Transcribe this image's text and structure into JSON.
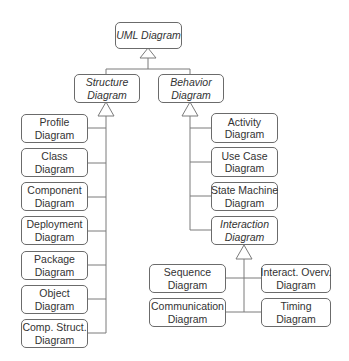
{
  "root": {
    "line1": "UML Diagram",
    "abstract": true
  },
  "structure": {
    "header": {
      "line1": "Structure",
      "line2": "Diagram",
      "abstract": true
    },
    "children": [
      {
        "line1": "Profile",
        "line2": "Diagram"
      },
      {
        "line1": "Class",
        "line2": "Diagram"
      },
      {
        "line1": "Component",
        "line2": "Diagram"
      },
      {
        "line1": "Deployment",
        "line2": "Diagram"
      },
      {
        "line1": "Package",
        "line2": "Diagram"
      },
      {
        "line1": "Object",
        "line2": "Diagram"
      },
      {
        "line1": "Comp. Struct.",
        "line2": "Diagram"
      }
    ]
  },
  "behavior": {
    "header": {
      "line1": "Behavior",
      "line2": "Diagram",
      "abstract": true
    },
    "children": [
      {
        "line1": "Activity",
        "line2": "Diagram"
      },
      {
        "line1": "Use Case",
        "line2": "Diagram"
      },
      {
        "line1": "State Machine",
        "line2": "Diagram"
      },
      {
        "line1": "Interaction",
        "line2": "Diagram",
        "abstract": true
      }
    ]
  },
  "interaction": {
    "children": [
      {
        "line1": "Sequence",
        "line2": "Diagram"
      },
      {
        "line1": "Interact. Overv.",
        "line2": "Diagram"
      },
      {
        "line1": "Communication",
        "line2": "Diagram"
      },
      {
        "line1": "Timing",
        "line2": "Diagram"
      }
    ]
  },
  "colors": {
    "line": "#7a7a7a",
    "border": "#6b6b6b",
    "text": "#333333"
  }
}
